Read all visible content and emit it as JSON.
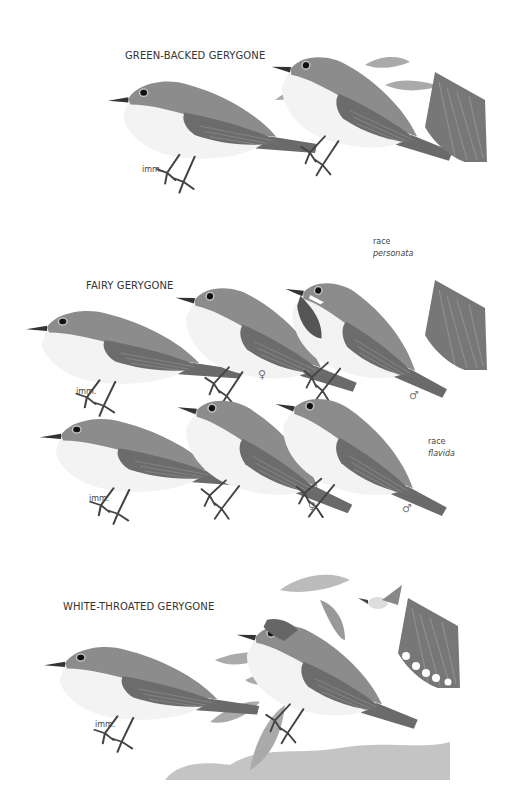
{
  "plate": {
    "background": "#ffffff",
    "colors": {
      "upperparts": "#8a8a8a",
      "wing": "#6e6e6e",
      "underparts": "#f4f4f4",
      "dark_throat": "#555555",
      "foliage": "#a5a5a5",
      "legs": "#444444"
    }
  },
  "species": [
    {
      "name": "GREEN-BACKED GERYGONE",
      "figures": [
        {
          "label": "imm."
        },
        {
          "label": ""
        }
      ],
      "extras": [
        "leaf-sprig",
        "tail-detail"
      ]
    },
    {
      "name": "FAIRY GERYGONE",
      "figures": [
        {
          "label": "imm.",
          "row": 1
        },
        {
          "label": "♀",
          "row": 1
        },
        {
          "label": "♂",
          "row": 1,
          "race_label": "race",
          "race_name": "personata"
        },
        {
          "label": "imm.",
          "row": 2
        },
        {
          "label": "♀",
          "row": 2
        },
        {
          "label": "♂",
          "row": 2,
          "race_label": "race",
          "race_name": "flavida"
        }
      ],
      "extras": [
        "tail-detail"
      ]
    },
    {
      "name": "WHITE-THROATED GERYGONE",
      "figures": [
        {
          "label": "imm."
        },
        {
          "label": ""
        }
      ],
      "extras": [
        "eucalyptus-branch",
        "hovering-bird",
        "tail-detail-white-tips",
        "woodland-background"
      ]
    }
  ]
}
